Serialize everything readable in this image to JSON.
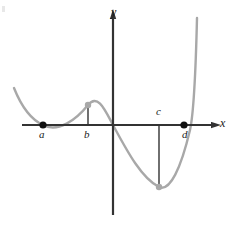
{
  "figure": {
    "background_color": "#ffffff",
    "axis_color": "#333333",
    "curve_color": "#a8a8a8",
    "root_dot_color": "#111111",
    "extremum_dot_color": "#a8a8a8",
    "connector_color": "#333333"
  },
  "axes": {
    "x_label": "x",
    "y_label": "y",
    "x_axis": {
      "y_px": 125,
      "x_start_px": 22,
      "x_end_px": 212,
      "arrow": "right"
    },
    "y_axis": {
      "x_px": 113,
      "y_start_px": 18,
      "y_end_px": 215,
      "arrow": "up"
    }
  },
  "points": [
    {
      "id": "a",
      "label": "a",
      "kind": "x-intercept",
      "dot": "black",
      "x_px": 43,
      "y_px": 125,
      "label_x_px": 39,
      "label_y_px": 129,
      "connector": false
    },
    {
      "id": "b",
      "label": "b",
      "kind": "local-maximum",
      "dot": "gray",
      "x_px": 88,
      "y_px": 105,
      "label_x_px": 84,
      "label_y_px": 129,
      "connector": true
    },
    {
      "id": "c",
      "label": "c",
      "kind": "local-minimum",
      "dot": "gray",
      "x_px": 159,
      "y_px": 187,
      "label_x_px": 156,
      "label_y_px": 108,
      "connector": true
    },
    {
      "id": "d",
      "label": "d",
      "kind": "x-intercept",
      "dot": "black",
      "x_px": 184,
      "y_px": 125,
      "label_x_px": 182,
      "label_y_px": 129,
      "connector": false
    }
  ],
  "chart_data": {
    "type": "line",
    "title": "",
    "xlabel": "x",
    "ylabel": "y",
    "grid": false,
    "legend": "none",
    "annotations": [
      {
        "text": "a",
        "type": "x-intercept"
      },
      {
        "text": "b",
        "type": "local-maximum"
      },
      {
        "text": "c",
        "type": "local-minimum"
      },
      {
        "text": "d",
        "type": "x-intercept"
      }
    ],
    "curve_path_px": "M 14,88 C 22,108 32,120 43,125 C 58,133 76,120 88,105 C 98,93 105,110 113,125 C 126,149 141,178 159,187 C 170,192 181,168 190,130 C 194,112 196,60 197,18",
    "curve_points_px": [
      [
        14,
        88
      ],
      [
        43,
        125
      ],
      [
        88,
        105
      ],
      [
        113,
        125
      ],
      [
        159,
        187
      ],
      [
        184,
        125
      ],
      [
        197,
        18
      ]
    ]
  }
}
